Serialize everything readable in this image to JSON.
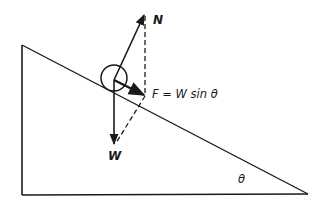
{
  "diagram": {
    "type": "free-body diagram on inclined plane",
    "labels": {
      "normal_force": "N",
      "weight": "W",
      "friction_force": "F = W sin θ",
      "angle": "θ"
    },
    "colors": {
      "stroke": "#1a1a1a",
      "background": "#ffffff"
    }
  }
}
